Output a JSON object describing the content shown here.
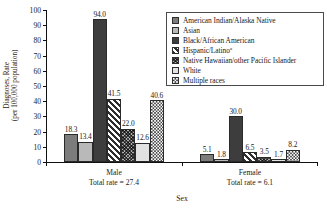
{
  "chart_data": {
    "type": "bar",
    "title": "",
    "xlabel": "Sex",
    "ylabel_line1": "Diagnoses, Rate",
    "ylabel_line2": "(per 100,000 population)",
    "categories": [
      "Male",
      "Female"
    ],
    "category_sublabels": [
      "Total rate = 27.4",
      "Total rate = 6.1"
    ],
    "ylim": [
      0,
      100
    ],
    "yticks": [
      0,
      10,
      20,
      30,
      40,
      50,
      60,
      70,
      80,
      90,
      100
    ],
    "ytick_labels": [
      "0",
      "10",
      "20",
      "30",
      "40",
      "50",
      "60",
      "70",
      "80",
      "90",
      "100"
    ],
    "grid": false,
    "legend_position": "top-right",
    "series": [
      {
        "name": "American Indian/Alaska Native",
        "pattern": "solid-medium-gray",
        "values": [
          18.3,
          5.1
        ],
        "labels": [
          "18.3",
          "5.1"
        ]
      },
      {
        "name": "Asian",
        "pattern": "solid-light-gray",
        "values": [
          13.4,
          1.8
        ],
        "labels": [
          "13.4",
          "1.8"
        ]
      },
      {
        "name": "Black/African American",
        "pattern": "solid-dark-gray",
        "values": [
          94.0,
          30.0
        ],
        "labels": [
          "94.0",
          "30.0"
        ]
      },
      {
        "name": "Hispanic/Latino",
        "pattern": "diagonal-stripes",
        "superscript": "a",
        "values": [
          41.5,
          6.5
        ],
        "labels": [
          "41.5",
          "6.5"
        ]
      },
      {
        "name": "Native Hawaiian/other Pacific Islander",
        "pattern": "crosshatch",
        "values": [
          22.0,
          3.5
        ],
        "labels": [
          "22.0",
          "3.5"
        ]
      },
      {
        "name": "White",
        "pattern": "solid-very-light-gray",
        "values": [
          12.6,
          1.7
        ],
        "labels": [
          "12.6",
          "1.7"
        ]
      },
      {
        "name": "Multiple races",
        "pattern": "checkerboard",
        "values": [
          40.6,
          8.2
        ],
        "labels": [
          "40.6",
          "8.2"
        ]
      }
    ]
  },
  "axis": {
    "x_title": "Sex",
    "y_title_line1": "Diagnoses, Rate",
    "y_title_line2": "(per 100,000 population)"
  },
  "groups": [
    {
      "label": "Male",
      "sublabel": "Total rate = 27.4"
    },
    {
      "label": "Female",
      "sublabel": "Total rate = 6.1"
    }
  ],
  "legend": {
    "items": [
      {
        "label": "American Indian/Alaska Native",
        "sup": ""
      },
      {
        "label": "Asian",
        "sup": ""
      },
      {
        "label": "Black/African American",
        "sup": ""
      },
      {
        "label": "Hispanic/Latino",
        "sup": "a"
      },
      {
        "label": "Native Hawaiian/other Pacific Islander",
        "sup": ""
      },
      {
        "label": "White",
        "sup": ""
      },
      {
        "label": "Multiple races",
        "sup": ""
      }
    ]
  },
  "colors": {
    "aian": "#7c7c7c",
    "asian": "#b9b9b9",
    "black": "#3d3d3d",
    "hispanic": "#2e2e2e",
    "nhpi": "#4a4a4a",
    "white": "#e2e2e2",
    "multiple": "#454545",
    "axis": "#111111",
    "background": "#ffffff"
  }
}
